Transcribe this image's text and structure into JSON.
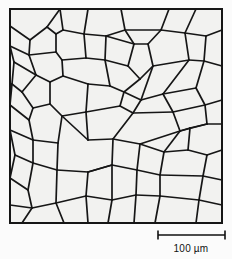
{
  "figure": {
    "type": "microstructure-grain-map",
    "title": "",
    "background_color": "#fbfbfb",
    "panel_fill": "#f2f2f0",
    "line_color": "#161616",
    "frame": {
      "x": 10,
      "y": 9,
      "width": 212,
      "height": 214,
      "stroke_width": 2
    }
  },
  "scalebar": {
    "label": "100 µm",
    "value": 100,
    "unit": "µm",
    "x_start": 158,
    "x_end": 225,
    "y": 235,
    "tick_height": 9,
    "label_x": 191,
    "label_y": 252,
    "color": "#111111"
  },
  "chart_data": {
    "type": "diagram",
    "grain_count": 58,
    "edges": [
      [
        10,
        9,
        222,
        9
      ],
      [
        222,
        9,
        222,
        223
      ],
      [
        222,
        223,
        10,
        223
      ],
      [
        10,
        223,
        10,
        9
      ],
      [
        10,
        26,
        30,
        40
      ],
      [
        30,
        40,
        47,
        27
      ],
      [
        47,
        27,
        60,
        9
      ],
      [
        30,
        40,
        29,
        55
      ],
      [
        10,
        46,
        29,
        55
      ],
      [
        29,
        55,
        56,
        52
      ],
      [
        56,
        52,
        56,
        34
      ],
      [
        56,
        34,
        47,
        27
      ],
      [
        56,
        52,
        62,
        60
      ],
      [
        62,
        60,
        63,
        76
      ],
      [
        63,
        76,
        50,
        82
      ],
      [
        50,
        82,
        36,
        75
      ],
      [
        36,
        75,
        29,
        55
      ],
      [
        10,
        46,
        14,
        62
      ],
      [
        14,
        62,
        36,
        75
      ],
      [
        14,
        62,
        12,
        84
      ],
      [
        12,
        84,
        22,
        92
      ],
      [
        22,
        92,
        36,
        75
      ],
      [
        22,
        92,
        33,
        108
      ],
      [
        33,
        108,
        50,
        104
      ],
      [
        50,
        104,
        50,
        82
      ],
      [
        33,
        108,
        29,
        120
      ],
      [
        10,
        84,
        12,
        84
      ],
      [
        12,
        84,
        10,
        105
      ],
      [
        10,
        105,
        29,
        120
      ],
      [
        29,
        120,
        33,
        140
      ],
      [
        33,
        140,
        58,
        143
      ],
      [
        58,
        143,
        62,
        116
      ],
      [
        62,
        116,
        50,
        104
      ],
      [
        62,
        116,
        86,
        112
      ],
      [
        10,
        130,
        33,
        140
      ],
      [
        33,
        140,
        33,
        163
      ],
      [
        33,
        163,
        57,
        170
      ],
      [
        57,
        170,
        58,
        143
      ],
      [
        10,
        130,
        15,
        155
      ],
      [
        15,
        155,
        33,
        163
      ],
      [
        15,
        155,
        10,
        178
      ],
      [
        10,
        178,
        28,
        190
      ],
      [
        28,
        190,
        33,
        163
      ],
      [
        28,
        190,
        32,
        208
      ],
      [
        32,
        208,
        56,
        203
      ],
      [
        56,
        203,
        57,
        170
      ],
      [
        32,
        208,
        22,
        223
      ],
      [
        10,
        205,
        32,
        208
      ],
      [
        10,
        205,
        10,
        178
      ],
      [
        56,
        203,
        64,
        223
      ],
      [
        56,
        203,
        86,
        196
      ],
      [
        86,
        196,
        88,
        172
      ],
      [
        88,
        172,
        57,
        170
      ],
      [
        88,
        172,
        112,
        165
      ],
      [
        60,
        9,
        63,
        30
      ],
      [
        63,
        30,
        56,
        34
      ],
      [
        63,
        30,
        84,
        34
      ],
      [
        84,
        34,
        88,
        9
      ],
      [
        84,
        34,
        86,
        58
      ],
      [
        86,
        58,
        62,
        60
      ],
      [
        86,
        58,
        105,
        60
      ],
      [
        105,
        60,
        106,
        36
      ],
      [
        106,
        36,
        84,
        34
      ],
      [
        106,
        36,
        125,
        30
      ],
      [
        125,
        30,
        121,
        9
      ],
      [
        125,
        30,
        134,
        44
      ],
      [
        134,
        44,
        106,
        36
      ],
      [
        134,
        44,
        128,
        66
      ],
      [
        128,
        66,
        105,
        60
      ],
      [
        128,
        66,
        140,
        79
      ],
      [
        140,
        79,
        153,
        66
      ],
      [
        153,
        66,
        148,
        44
      ],
      [
        148,
        44,
        134,
        44
      ],
      [
        148,
        44,
        161,
        30
      ],
      [
        161,
        30,
        125,
        30
      ],
      [
        161,
        30,
        169,
        9
      ],
      [
        161,
        30,
        185,
        33
      ],
      [
        185,
        33,
        196,
        9
      ],
      [
        185,
        33,
        189,
        60
      ],
      [
        189,
        60,
        153,
        66
      ],
      [
        189,
        60,
        204,
        61
      ],
      [
        204,
        61,
        206,
        36
      ],
      [
        206,
        36,
        185,
        33
      ],
      [
        206,
        36,
        222,
        30
      ],
      [
        204,
        61,
        222,
        66
      ],
      [
        86,
        112,
        88,
        84
      ],
      [
        88,
        84,
        63,
        76
      ],
      [
        88,
        84,
        110,
        86
      ],
      [
        110,
        86,
        105,
        60
      ],
      [
        110,
        86,
        124,
        92
      ],
      [
        124,
        92,
        140,
        79
      ],
      [
        124,
        92,
        120,
        106
      ],
      [
        120,
        106,
        86,
        112
      ],
      [
        120,
        106,
        133,
        113
      ],
      [
        133,
        113,
        141,
        100
      ],
      [
        141,
        100,
        124,
        92
      ],
      [
        141,
        100,
        153,
        66
      ],
      [
        141,
        100,
        163,
        94
      ],
      [
        163,
        94,
        189,
        60
      ],
      [
        163,
        94,
        173,
        112
      ],
      [
        173,
        112,
        133,
        113
      ],
      [
        163,
        94,
        196,
        88
      ],
      [
        196,
        88,
        204,
        61
      ],
      [
        196,
        88,
        205,
        105
      ],
      [
        205,
        105,
        173,
        112
      ],
      [
        205,
        105,
        222,
        100
      ],
      [
        205,
        105,
        207,
        124
      ],
      [
        207,
        124,
        222,
        124
      ],
      [
        207,
        124,
        180,
        131
      ],
      [
        180,
        131,
        173,
        112
      ],
      [
        86,
        112,
        88,
        140
      ],
      [
        88,
        140,
        62,
        116
      ],
      [
        88,
        140,
        113,
        139
      ],
      [
        113,
        139,
        112,
        165
      ],
      [
        112,
        165,
        88,
        172
      ],
      [
        113,
        139,
        133,
        113
      ],
      [
        113,
        139,
        140,
        144
      ],
      [
        140,
        144,
        180,
        131
      ],
      [
        140,
        144,
        137,
        170
      ],
      [
        137,
        170,
        112,
        165
      ],
      [
        137,
        170,
        160,
        175
      ],
      [
        160,
        175,
        164,
        152
      ],
      [
        164,
        152,
        140,
        144
      ],
      [
        164,
        152,
        180,
        131
      ],
      [
        164,
        152,
        188,
        150
      ],
      [
        188,
        150,
        190,
        128
      ],
      [
        190,
        128,
        180,
        131
      ],
      [
        190,
        128,
        207,
        124
      ],
      [
        188,
        150,
        207,
        155
      ],
      [
        207,
        155,
        222,
        150
      ],
      [
        207,
        155,
        203,
        176
      ],
      [
        203,
        176,
        160,
        175
      ],
      [
        203,
        176,
        222,
        180
      ],
      [
        203,
        176,
        199,
        200
      ],
      [
        199,
        200,
        160,
        196
      ],
      [
        160,
        196,
        160,
        175
      ],
      [
        199,
        200,
        222,
        205
      ],
      [
        199,
        200,
        196,
        223
      ],
      [
        160,
        196,
        155,
        223
      ],
      [
        160,
        196,
        136,
        195
      ],
      [
        136,
        195,
        137,
        170
      ],
      [
        136,
        195,
        134,
        223
      ],
      [
        136,
        195,
        112,
        200
      ],
      [
        112,
        200,
        112,
        165
      ],
      [
        112,
        200,
        108,
        223
      ],
      [
        112,
        200,
        86,
        196
      ],
      [
        86,
        196,
        88,
        223
      ]
    ]
  }
}
